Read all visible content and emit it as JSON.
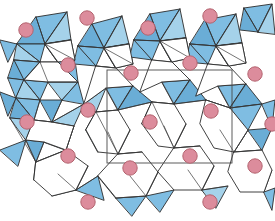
{
  "figure": {
    "width": 275,
    "height": 221,
    "background_color": "#ffffff"
  },
  "style": {
    "tetrahedron_fill": "#7fbde2",
    "tetrahedron_fill_light": "#a5d2ea",
    "tetrahedron_fill_dark": "#6aadd6",
    "tetrahedron_stroke": "#2b2b2b",
    "tetrahedron_stroke_width": 0.9,
    "inner_edge_stroke": "#3a3a3a",
    "inner_edge_width": 0.7,
    "void_fill": "#ffffff",
    "void_stroke": "#2b2b2b",
    "cation_fill": "#dc8c9c",
    "cation_stroke": "#b4636f",
    "cation_radius": 7.2,
    "unit_cell_stroke": "#4a4a4a",
    "unit_cell_width": 0.9
  },
  "unit_cell": {
    "label": "unit cell",
    "x": 107,
    "y": 70,
    "width": 125,
    "height": 93
  },
  "cations": {
    "label": "cation site",
    "element_color": "#dc8c9c",
    "count": 19,
    "positions": [
      {
        "cx": 26,
        "cy": 30
      },
      {
        "cx": 87,
        "cy": 18
      },
      {
        "cx": 148,
        "cy": 28
      },
      {
        "cx": 210,
        "cy": 16
      },
      {
        "cx": 68,
        "cy": 65
      },
      {
        "cx": 131,
        "cy": 73
      },
      {
        "cx": 190,
        "cy": 63
      },
      {
        "cx": 255,
        "cy": 74
      },
      {
        "cx": 27,
        "cy": 122
      },
      {
        "cx": 88,
        "cy": 110
      },
      {
        "cx": 150,
        "cy": 122
      },
      {
        "cx": 211,
        "cy": 111
      },
      {
        "cx": 68,
        "cy": 156
      },
      {
        "cx": 130,
        "cy": 168
      },
      {
        "cx": 190,
        "cy": 156
      },
      {
        "cx": 255,
        "cy": 166
      },
      {
        "cx": 88,
        "cy": 202
      },
      {
        "cx": 210,
        "cy": 202
      },
      {
        "cx": 272,
        "cy": 124
      }
    ]
  },
  "polyhedra": {
    "label": "tetrahedron",
    "count": 72,
    "faces": [
      {
        "points": "36,17 67,12 45,44",
        "shade": "base"
      },
      {
        "points": "36,17 45,44 17,44",
        "shade": "dark"
      },
      {
        "points": "67,12 71,40 45,44",
        "shade": "light"
      },
      {
        "points": "17,44 45,44 40,62",
        "shade": "base"
      },
      {
        "points": "71,40 75,60 45,44",
        "shade": "base"
      },
      {
        "points": "45,44 75,60 58,62",
        "shade": "dark"
      },
      {
        "points": "17,44 40,62 14,60",
        "shade": "light"
      },
      {
        "points": "14,60 40,62 24,80",
        "shade": "base"
      },
      {
        "points": "40,62 58,62 48,82",
        "shade": "light"
      },
      {
        "points": "24,80 48,82 40,100",
        "shade": "base"
      },
      {
        "points": "14,60 24,80 8,78",
        "shade": "dark"
      },
      {
        "points": "58,62 75,60 78,82",
        "shade": "base"
      },
      {
        "points": "48,82 78,82 62,100",
        "shade": "light"
      },
      {
        "points": "92,24 122,16 104,48",
        "shade": "base"
      },
      {
        "points": "122,16 129,44 104,48",
        "shade": "light"
      },
      {
        "points": "92,24 104,48 78,46",
        "shade": "dark"
      },
      {
        "points": "78,46 104,48 96,66",
        "shade": "base"
      },
      {
        "points": "129,44 133,64 104,48",
        "shade": "base"
      },
      {
        "points": "104,48 133,64 116,68",
        "shade": "dark"
      },
      {
        "points": "96,66 116,68 106,88",
        "shade": "light"
      },
      {
        "points": "78,46 96,66 74,64",
        "shade": "base"
      },
      {
        "points": "150,14 180,9 160,41",
        "shade": "base"
      },
      {
        "points": "180,9 186,38 160,41",
        "shade": "light"
      },
      {
        "points": "150,14 160,41 134,40",
        "shade": "dark"
      },
      {
        "points": "134,40 160,41 152,60",
        "shade": "base"
      },
      {
        "points": "186,38 190,58 160,41",
        "shade": "base"
      },
      {
        "points": "160,41 190,58 172,62",
        "shade": "dark"
      },
      {
        "points": "152,60 172,62 162,82",
        "shade": "light"
      },
      {
        "points": "134,40 152,60 130,57",
        "shade": "base"
      },
      {
        "points": "205,20 236,14 216,46",
        "shade": "base"
      },
      {
        "points": "236,14 242,43 216,46",
        "shade": "light"
      },
      {
        "points": "205,20 216,46 190,44",
        "shade": "dark"
      },
      {
        "points": "190,44 216,46 208,64",
        "shade": "base"
      },
      {
        "points": "242,43 246,63 216,46",
        "shade": "base"
      },
      {
        "points": "216,46 246,63 229,66",
        "shade": "dark"
      },
      {
        "points": "208,64 229,66 218,86",
        "shade": "light"
      },
      {
        "points": "190,44 208,64 186,62",
        "shade": "base"
      },
      {
        "points": "244,8 272,4 258,32",
        "shade": "base"
      },
      {
        "points": "258,32 272,4 275,34",
        "shade": "light"
      },
      {
        "points": "244,8 258,32 240,30",
        "shade": "dark"
      },
      {
        "points": "8,78 24,80 16,98",
        "shade": "base"
      },
      {
        "points": "24,80 40,100 16,98",
        "shade": "light"
      },
      {
        "points": "16,98 40,100 34,120",
        "shade": "base"
      },
      {
        "points": "40,100 62,100 52,122",
        "shade": "dark"
      },
      {
        "points": "62,100 78,82 84,104",
        "shade": "base"
      },
      {
        "points": "52,122 84,104 74,126",
        "shade": "light"
      },
      {
        "points": "34,120 52,122 44,142",
        "shade": "base"
      },
      {
        "points": "16,98 34,120 10,118",
        "shade": "dark"
      },
      {
        "points": "106,88 133,86 118,110",
        "shade": "base"
      },
      {
        "points": "84,104 106,88 96,112",
        "shade": "light"
      },
      {
        "points": "96,112 118,110 108,132",
        "shade": "base"
      },
      {
        "points": "133,86 152,102 118,110",
        "shade": "dark"
      },
      {
        "points": "162,82 190,80 174,104",
        "shade": "base"
      },
      {
        "points": "152,102 174,104 164,126",
        "shade": "light"
      },
      {
        "points": "190,80 206,100 174,104",
        "shade": "dark"
      },
      {
        "points": "218,86 246,84 230,108",
        "shade": "base"
      },
      {
        "points": "206,100 230,108 220,130",
        "shade": "light"
      },
      {
        "points": "246,84 262,104 230,108",
        "shade": "dark"
      },
      {
        "points": "262,104 275,100 272,128",
        "shade": "base"
      },
      {
        "points": "230,108 262,104 248,130",
        "shade": "base"
      },
      {
        "points": "10,118 34,120 26,140",
        "shade": "light"
      },
      {
        "points": "44,142 74,126 66,150",
        "shade": "base"
      },
      {
        "points": "26,140 44,142 36,162",
        "shade": "dark"
      },
      {
        "points": "36,162 66,150 58,174",
        "shade": "base"
      },
      {
        "points": "108,132 130,130 118,154",
        "shade": "base"
      },
      {
        "points": "96,112 108,132 86,130",
        "shade": "light"
      },
      {
        "points": "86,130 108,132 98,152",
        "shade": "base"
      },
      {
        "points": "164,126 186,124 174,148",
        "shade": "base"
      },
      {
        "points": "152,102 164,126 142,124",
        "shade": "light"
      },
      {
        "points": "220,130 248,130 234,152",
        "shade": "base"
      },
      {
        "points": "248,130 272,128 262,150",
        "shade": "dark"
      },
      {
        "points": "58,174 88,166 76,190",
        "shade": "base"
      },
      {
        "points": "36,162 58,174 34,180",
        "shade": "light"
      },
      {
        "points": "76,190 98,176 104,200",
        "shade": "base"
      },
      {
        "points": "118,154 142,152 130,176",
        "shade": "base"
      },
      {
        "points": "130,176 158,172 146,196",
        "shade": "light"
      },
      {
        "points": "174,148 200,146 188,170",
        "shade": "base"
      },
      {
        "points": "188,170 214,166 202,190",
        "shade": "dark"
      },
      {
        "points": "234,152 262,150 250,174",
        "shade": "base"
      },
      {
        "points": "250,174 272,170 264,192",
        "shade": "light"
      },
      {
        "points": "0,40 17,44 8,62",
        "shade": "base"
      },
      {
        "points": "0,92 16,98 8,116",
        "shade": "dark"
      },
      {
        "points": "0,150 26,140 18,166",
        "shade": "base"
      },
      {
        "points": "98,176 130,176 116,198",
        "shade": "base"
      },
      {
        "points": "146,196 174,190 160,212",
        "shade": "base"
      },
      {
        "points": "202,190 228,186 216,208",
        "shade": "light"
      },
      {
        "points": "58,174 76,190 52,196",
        "shade": "dark"
      },
      {
        "points": "116,198 146,196 132,216",
        "shade": "base"
      },
      {
        "points": "264,192 275,188 272,210",
        "shade": "base"
      }
    ],
    "inner_edges": [
      "36,17 45,44",
      "67,12 45,44",
      "17,44 40,62",
      "71,40 45,44",
      "75,60 45,44",
      "58,62 45,44",
      "14,60 40,62",
      "24,80 40,62",
      "48,82 40,62",
      "78,82 48,82",
      "40,100 24,80",
      "92,24 104,48",
      "122,16 104,48",
      "78,46 104,48",
      "129,44 104,48",
      "133,64 104,48",
      "116,68 104,48",
      "96,66 116,68",
      "150,14 160,41",
      "180,9 160,41",
      "134,40 160,41",
      "186,38 160,41",
      "190,58 160,41",
      "172,62 160,41",
      "205,20 216,46",
      "236,14 216,46",
      "190,44 216,46",
      "242,43 216,46",
      "246,63 216,46",
      "229,66 216,46",
      "244,8 258,32",
      "272,4 258,32",
      "16,98 34,120",
      "40,100 34,120",
      "52,122 34,120",
      "62,100 52,122",
      "84,104 52,122",
      "74,126 52,122",
      "106,88 118,110",
      "133,86 118,110",
      "96,112 118,110",
      "152,102 118,110",
      "162,82 174,104",
      "190,80 174,104",
      "152,102 174,104",
      "206,100 174,104",
      "218,86 230,108",
      "246,84 230,108",
      "206,100 230,108",
      "262,104 230,108",
      "10,118 36,162",
      "44,142 36,162",
      "26,140 36,162",
      "66,150 36,162",
      "74,126 66,150",
      "108,132 118,154",
      "130,130 118,154",
      "96,112 118,154",
      "142,152 118,154",
      "164,126 174,148",
      "186,124 174,148",
      "152,102 174,148",
      "200,146 174,148",
      "220,130 234,152",
      "248,130 234,152",
      "262,150 234,152",
      "58,174 76,190",
      "88,166 76,190",
      "98,176 76,190",
      "130,176 146,196",
      "158,172 146,196",
      "116,198 146,196",
      "188,170 202,190",
      "214,166 202,190",
      "228,186 202,190"
    ]
  },
  "voids": {
    "label": "channel void",
    "polygons": [
      {
        "points": "45,44 71,40 75,60 58,62",
        "shape": "square"
      },
      {
        "points": "104,48 129,44 133,64 116,68",
        "shape": "square"
      },
      {
        "points": "160,41 186,38 190,58 172,62",
        "shape": "square"
      },
      {
        "points": "216,46 242,43 246,63 229,66",
        "shape": "square"
      },
      {
        "points": "40,62 58,62 78,82 48,82 24,80",
        "shape": "pentagon"
      },
      {
        "points": "96,66 116,68 133,86 106,88 84,104",
        "shape": "pentagon"
      },
      {
        "points": "152,60 172,62 190,80 162,82 140,92",
        "shape": "pentagon"
      },
      {
        "points": "208,64 229,66 246,84 218,86 196,96",
        "shape": "pentagon"
      },
      {
        "points": "34,120 52,122 74,126 66,150 44,142 26,140",
        "shape": "hexagon"
      },
      {
        "points": "96,112 118,110 130,130 118,154 98,152 86,130",
        "shape": "hexagon"
      },
      {
        "points": "152,102 174,104 186,124 174,148 158,146 142,124",
        "shape": "hexagon"
      },
      {
        "points": "206,100 230,108 248,130 234,152 214,148 200,124",
        "shape": "hexagon"
      },
      {
        "points": "36,162 66,150 88,166 76,190 52,196 34,180",
        "shape": "hexagon"
      },
      {
        "points": "118,154 142,152 158,172 146,196 116,198 98,176",
        "shape": "hexagon"
      },
      {
        "points": "174,148 200,146 214,166 202,190 174,190 158,172",
        "shape": "hexagon"
      },
      {
        "points": "234,152 262,150 272,170 264,192 240,192 228,172",
        "shape": "hexagon"
      }
    ]
  }
}
